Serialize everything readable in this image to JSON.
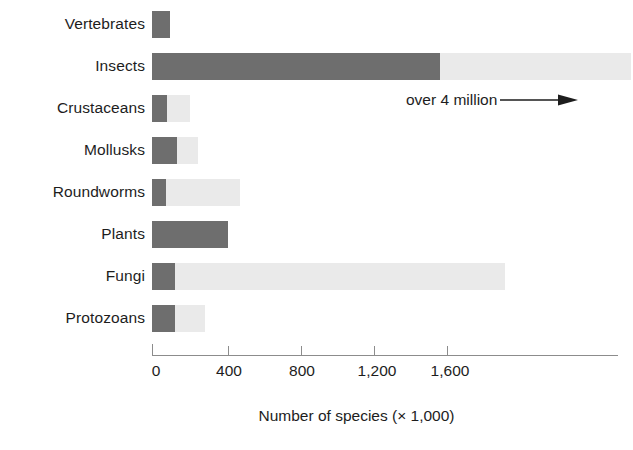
{
  "chart_data": {
    "type": "bar",
    "orientation": "horizontal",
    "title": "",
    "subtitle": "",
    "xlabel": "Number of species (× 1,000)",
    "ylabel": "",
    "xlim": [
      0,
      2600
    ],
    "xticks": [
      0,
      400,
      800,
      1200,
      1600
    ],
    "xtick_labels": [
      "0",
      "400",
      "800",
      "1,200",
      "1,600"
    ],
    "grid": false,
    "legend": null,
    "categories": [
      "Vertebrates",
      "Insects",
      "Crustaceans",
      "Mollusks",
      "Roundworms",
      "Plants",
      "Fungi",
      "Protozoans"
    ],
    "series": [
      {
        "name": "Described species",
        "color": "#6e6e6e",
        "values": [
          100,
          1600,
          85,
          140,
          80,
          420,
          130,
          130
        ]
      },
      {
        "name": "Estimated additional species",
        "color": "#eaeaea",
        "values": [
          0,
          1060,
          125,
          115,
          410,
          0,
          1830,
          165
        ]
      }
    ],
    "totals": [
      100,
      2660,
      210,
      255,
      490,
      420,
      1960,
      295
    ],
    "annotations": [
      {
        "text": "over 4 million",
        "arrow": "right",
        "target_category": "Insects",
        "note": "points right past the edge of the Insects bar"
      }
    ]
  },
  "axis": {
    "ticks": [
      {
        "label": "0",
        "value": 0
      },
      {
        "label": "400",
        "value": 400
      },
      {
        "label": "800",
        "value": 800
      },
      {
        "label": "1,200",
        "value": 1200
      },
      {
        "label": "1,600",
        "value": 1600
      }
    ],
    "title": "Number of species (× 1,000)"
  },
  "annotation": {
    "text": "over 4 million"
  },
  "colors": {
    "bar_dark": "#6e6e6e",
    "bar_light": "#eaeaea",
    "axis": "#8c8c8c",
    "text": "#1d1d1d",
    "background": "#ffffff"
  }
}
